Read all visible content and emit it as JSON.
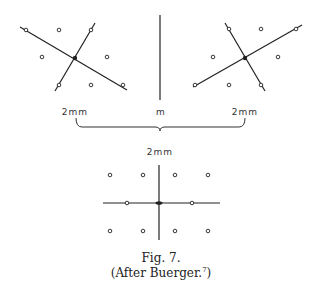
{
  "labels": {
    "left_scale": "2mm",
    "middle_symbol": "m",
    "right_scale": "2mm",
    "combined_scale": "2mm"
  },
  "caption": {
    "figure": "Fig. 7.",
    "source_prefix": "(After Buerger.",
    "source_ref": "7",
    "source_suffix": ")"
  },
  "diagrams": {
    "left": {
      "description": "Lattice with two rotated axes crossing at filled center point",
      "lines": [
        [
          20,
          27,
          127,
          90
        ],
        [
          55,
          91,
          95,
          23
        ]
      ],
      "center": [
        75,
        58
      ],
      "points": [
        [
          26,
          30
        ],
        [
          59,
          30
        ],
        [
          91,
          30
        ],
        [
          42,
          57
        ],
        [
          107,
          57
        ],
        [
          59,
          85
        ],
        [
          91,
          85
        ],
        [
          123,
          85
        ]
      ]
    },
    "mirror": {
      "description": "Mirror line m",
      "line": [
        160,
        15,
        160,
        100
      ]
    },
    "right": {
      "description": "Mirror image lattice with two rotated axes",
      "lines": [
        [
          193,
          87,
          302,
          25
        ],
        [
          225,
          23,
          265,
          91
        ]
      ],
      "center": [
        245,
        58
      ],
      "points": [
        [
          195,
          85
        ],
        [
          229,
          29
        ],
        [
          261,
          29
        ],
        [
          296,
          29
        ],
        [
          213,
          57
        ],
        [
          278,
          57
        ],
        [
          229,
          85
        ],
        [
          261,
          85
        ]
      ]
    },
    "bottom": {
      "description": "Combined lattice with orthogonal axes",
      "lines": [
        [
          103,
          203,
          220,
          203
        ],
        [
          159,
          165,
          159,
          240
        ]
      ],
      "center": [
        159,
        203
      ],
      "points": [
        [
          110,
          175
        ],
        [
          143,
          175
        ],
        [
          175,
          175
        ],
        [
          208,
          175
        ],
        [
          127,
          203
        ],
        [
          192,
          203
        ],
        [
          110,
          231
        ],
        [
          143,
          231
        ],
        [
          175,
          231
        ],
        [
          208,
          231
        ]
      ]
    },
    "brace": {
      "x1": 76,
      "x2": 245,
      "y_top": 118,
      "y_bottom": 130,
      "tip_x": 160
    }
  },
  "colors": {
    "ink": "#222222",
    "background": "#ffffff"
  }
}
